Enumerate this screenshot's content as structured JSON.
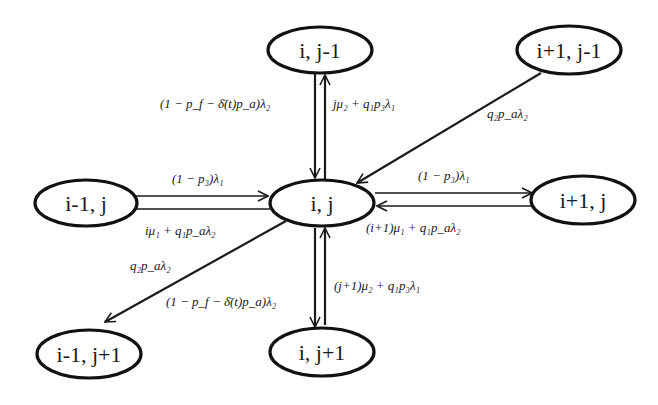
{
  "diagram": {
    "nodes": {
      "top_center": {
        "label": "i, j-1"
      },
      "top_right": {
        "label": "i+1, j-1"
      },
      "mid_left": {
        "label": "i-1, j"
      },
      "center": {
        "label": "i, j"
      },
      "mid_right": {
        "label": "i+1, j"
      },
      "bottom_left": {
        "label": "i-1, j+1"
      },
      "bottom_center": {
        "label": "i, j+1"
      }
    },
    "edges": {
      "center_to_top": {
        "from": "i, j",
        "to": "i, j-1",
        "label": "jμ₂ + q₁p₃λ₁"
      },
      "top_to_center": {
        "from": "i, j-1",
        "to": "i, j",
        "label": "(1 − p_f − δ̄(t)p_a)λ₂"
      },
      "topright_to_center": {
        "from": "i+1, j-1",
        "to": "i, j",
        "label": "q₂p_aλ₂"
      },
      "left_to_center": {
        "from": "i-1, j",
        "to": "i, j",
        "label": "(1 − p₃)λ₁"
      },
      "center_to_left": {
        "from": "i, j",
        "to": "i-1, j",
        "label": "iμ₁ + q₁p_aλ₂"
      },
      "center_to_right": {
        "from": "i, j",
        "to": "i+1, j",
        "label": "(1 − p₃)λ₁"
      },
      "right_to_center": {
        "from": "i+1, j",
        "to": "i, j",
        "label": "(i+1)μ₁ + q₁p_aλ₂"
      },
      "center_to_bottomleft": {
        "from": "i, j",
        "to": "i-1, j+1",
        "label": "q₂p_aλ₂"
      },
      "center_to_bottom": {
        "from": "i, j",
        "to": "i, j+1",
        "label": "(1 − p_f − δ̄(t)p_a)λ₂"
      },
      "bottom_to_center": {
        "from": "i, j+1",
        "to": "i, j",
        "label": "(j+1)μ₂ + q₁p₃λ₁"
      }
    },
    "colors": {
      "stroke": "#111111",
      "background": "#ffffff",
      "text": "#1a1a1a"
    }
  }
}
